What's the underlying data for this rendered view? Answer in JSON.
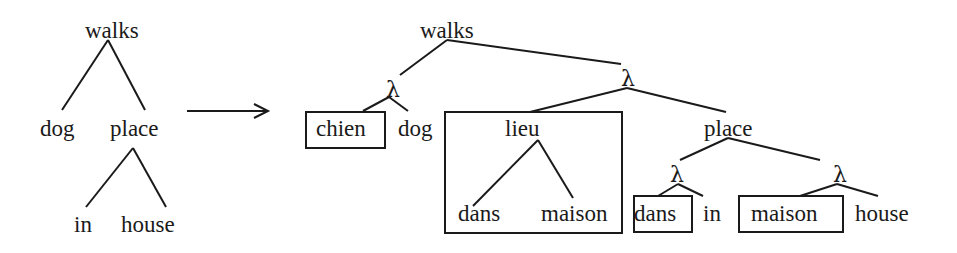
{
  "diagram": {
    "type": "tree-transformation",
    "source_tree": {
      "root": "walks",
      "children": [
        {
          "label": "dog"
        },
        {
          "label": "place",
          "children": [
            {
              "label": "in"
            },
            {
              "label": "house"
            }
          ]
        }
      ]
    },
    "arrow": "transforms-to",
    "target_tree": {
      "root": "walks",
      "lambda_symbol": "λ",
      "nodes": {
        "root": "walks",
        "lambda1": "λ",
        "chien": "chien",
        "dog": "dog",
        "lambda2": "λ",
        "lieu": "lieu",
        "dans_inner": "dans",
        "maison_inner": "maison",
        "place": "place",
        "lambda3": "λ",
        "dans_boxed": "dans",
        "in": "in",
        "lambda4": "λ",
        "maison_boxed": "maison",
        "house": "house"
      }
    }
  },
  "left": {
    "walks": "walks",
    "dog": "dog",
    "place": "place",
    "in": "in",
    "house": "house"
  },
  "right": {
    "walks": "walks",
    "lambda1": "λ",
    "chien": "chien",
    "dog": "dog",
    "lambda2": "λ",
    "lieu": "lieu",
    "dans1": "dans",
    "maison1": "maison",
    "place": "place",
    "lambda3": "λ",
    "dans2": "dans",
    "in": "in",
    "lambda4": "λ",
    "maison2": "maison",
    "house": "house"
  },
  "colors": {
    "ink": "#1a1a1a",
    "background": "#ffffff"
  }
}
